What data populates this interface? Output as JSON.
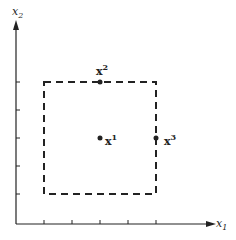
{
  "axes": {
    "x_label": "x",
    "x_sub": "1",
    "y_label": "x",
    "y_sub": "2"
  },
  "points": [
    {
      "name": "x",
      "sup": "1",
      "x": 100,
      "y": 138
    },
    {
      "name": "x",
      "sup": "2",
      "x": 100,
      "y": 82
    },
    {
      "name": "x",
      "sup": "3",
      "x": 156,
      "y": 138
    }
  ],
  "box": {
    "x1": 44,
    "y1": 82,
    "x2": 156,
    "y2": 194,
    "style": "dashed"
  },
  "colors": {
    "ink": "#222222"
  }
}
